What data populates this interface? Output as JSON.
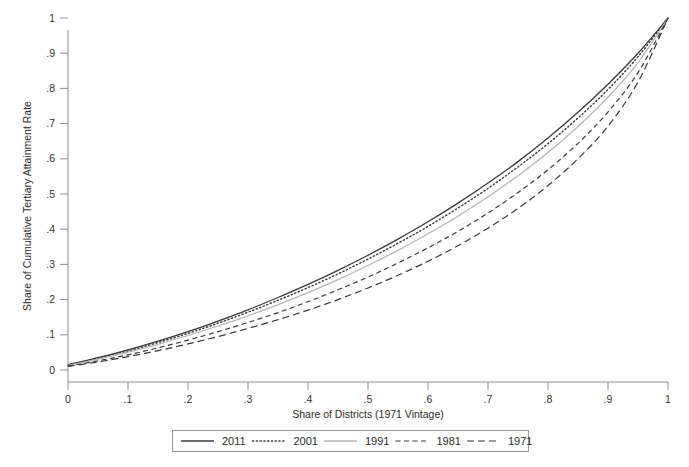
{
  "chart_data": {
    "type": "line",
    "title": "",
    "xlabel": "Share of Districts (1971 Vintage)",
    "ylabel": "Share of Cumulative Tertiary Attainment Rate",
    "xlim": [
      0,
      1
    ],
    "ylim": [
      0,
      1
    ],
    "grid": false,
    "legend_position": "bottom",
    "xticks": [
      "0",
      ".1",
      ".2",
      ".3",
      ".4",
      ".5",
      ".6",
      ".7",
      ".8",
      ".9",
      "1"
    ],
    "xtick_values": [
      0,
      0.1,
      0.2,
      0.3,
      0.4,
      0.5,
      0.6,
      0.7,
      0.8,
      0.9,
      1
    ],
    "yticks": [
      "0",
      ".1",
      ".2",
      ".3",
      ".4",
      ".5",
      ".6",
      ".7",
      ".8",
      ".9",
      "1"
    ],
    "ytick_values": [
      0,
      0.1,
      0.2,
      0.3,
      0.4,
      0.5,
      0.6,
      0.7,
      0.8,
      0.9,
      1
    ],
    "x": [
      0,
      0.05,
      0.1,
      0.15,
      0.2,
      0.25,
      0.3,
      0.35,
      0.4,
      0.45,
      0.5,
      0.55,
      0.6,
      0.65,
      0.7,
      0.75,
      0.8,
      0.85,
      0.9,
      0.95,
      1
    ],
    "series": [
      {
        "name": "2011",
        "style": "solid",
        "color": "#3a3a3a",
        "width": 1.3,
        "values": [
          0.015,
          0.035,
          0.057,
          0.082,
          0.109,
          0.139,
          0.171,
          0.206,
          0.243,
          0.283,
          0.326,
          0.372,
          0.421,
          0.474,
          0.531,
          0.592,
          0.659,
          0.732,
          0.812,
          0.9,
          1.0
        ]
      },
      {
        "name": "2001",
        "style": "dotted",
        "color": "#3a3a3a",
        "width": 1.4,
        "values": [
          0.014,
          0.033,
          0.054,
          0.078,
          0.104,
          0.133,
          0.164,
          0.198,
          0.234,
          0.273,
          0.315,
          0.36,
          0.408,
          0.46,
          0.516,
          0.577,
          0.643,
          0.716,
          0.797,
          0.89,
          1.0
        ]
      },
      {
        "name": "1991",
        "style": "solid",
        "color": "#b6b6b6",
        "width": 1.3,
        "values": [
          0.013,
          0.031,
          0.051,
          0.073,
          0.098,
          0.125,
          0.154,
          0.186,
          0.22,
          0.257,
          0.297,
          0.34,
          0.387,
          0.437,
          0.492,
          0.552,
          0.618,
          0.692,
          0.775,
          0.873,
          1.0
        ]
      },
      {
        "name": "1981",
        "style": "dashed",
        "color": "#3a3a3a",
        "width": 1.2,
        "values": [
          0.011,
          0.026,
          0.043,
          0.063,
          0.085,
          0.109,
          0.135,
          0.163,
          0.194,
          0.228,
          0.264,
          0.304,
          0.347,
          0.394,
          0.446,
          0.504,
          0.569,
          0.644,
          0.733,
          0.845,
          1.0
        ]
      },
      {
        "name": "1971",
        "style": "dashed-long",
        "color": "#3a3a3a",
        "width": 1.2,
        "values": [
          0.01,
          0.023,
          0.038,
          0.055,
          0.074,
          0.095,
          0.118,
          0.143,
          0.17,
          0.2,
          0.233,
          0.269,
          0.309,
          0.353,
          0.403,
          0.459,
          0.524,
          0.6,
          0.693,
          0.818,
          1.0
        ]
      }
    ]
  },
  "legend": {
    "entries": [
      {
        "label": "2011"
      },
      {
        "label": "2001"
      },
      {
        "label": "1991"
      },
      {
        "label": "1981"
      },
      {
        "label": "1971"
      }
    ]
  }
}
